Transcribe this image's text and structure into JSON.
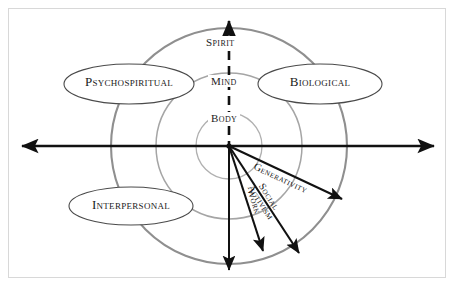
{
  "diagram": {
    "background_color": "#ffffff",
    "frame_color": "#d8d8d8",
    "axis_color": "#111111",
    "circle_color": "#9a9a9a",
    "ellipse_stroke_color": "#4a4a4a",
    "text_color": "#1a1a1a"
  },
  "domains": [
    {
      "id": "psychospiritual",
      "label": "Psychospiritual",
      "position": "upper-left"
    },
    {
      "id": "biological",
      "label": "Biological",
      "position": "upper-right"
    },
    {
      "id": "interpersonal",
      "label": "Interpersonal",
      "position": "lower-left"
    }
  ],
  "axis_labels": [
    {
      "id": "spirit",
      "label": "Spirit",
      "level": "outer"
    },
    {
      "id": "mind",
      "label": "Mind",
      "level": "middle"
    },
    {
      "id": "body",
      "label": "Body",
      "level": "inner"
    }
  ],
  "vectors": [
    {
      "id": "generativity",
      "label": "Generativity",
      "lines": [
        "Generativity"
      ],
      "angle_deg": 25
    },
    {
      "id": "social-activism",
      "label": "Social Activism",
      "lines": [
        "Social",
        "Activism"
      ],
      "angle_deg": 57
    },
    {
      "id": "work",
      "label": "Work",
      "lines": [
        "Work"
      ],
      "angle_deg": 72
    }
  ],
  "axes": {
    "horizontal": {
      "id": "horizontal-axis",
      "style": "solid",
      "arrowheads": "both"
    },
    "vertical": {
      "id": "vertical-axis",
      "style": "dashed-upper-solid-lower",
      "arrowheads": "both"
    }
  },
  "rings": [
    {
      "id": "inner-ring",
      "radius": 33
    },
    {
      "id": "middle-ring",
      "radius": 73
    },
    {
      "id": "outer-ring",
      "radius": 118
    }
  ]
}
